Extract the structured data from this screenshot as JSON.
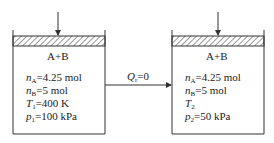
{
  "diagram": {
    "state1": {
      "mixture": "A+B",
      "nA_sym": "n",
      "nA_sub": "A",
      "nA_val": "=4.25 mol",
      "nB_sym": "n",
      "nB_sub": "B",
      "nB_val": "=5 mol",
      "T_sym": "T",
      "T_sub": "1",
      "T_val": "=400 K",
      "p_sym": "p",
      "p_sub": "1",
      "p_val": "=100 kPa"
    },
    "process": {
      "Q_sym": "Q",
      "Q_sub": "r",
      "Q_val": "=0"
    },
    "state2": {
      "mixture": "A+B",
      "nA_sym": "n",
      "nA_sub": "A",
      "nA_val": "=4.25 mol",
      "nB_sym": "n",
      "nB_sub": "B",
      "nB_val": "=5 mol",
      "T_sym": "T",
      "T_sub": "2",
      "T_val": "",
      "p_sym": "p",
      "p_sub": "2",
      "p_val": "=50 kPa"
    },
    "colors": {
      "stroke": "#333333",
      "background": "#ffffff"
    }
  }
}
